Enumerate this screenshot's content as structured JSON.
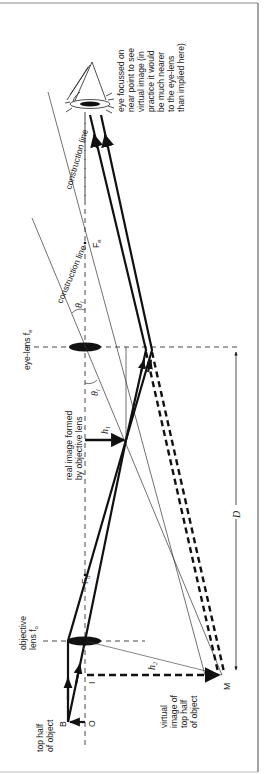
{
  "diagram": {
    "labels": {
      "eye_note": [
        "eye focussed on",
        "near point to see",
        "virtual image (in",
        "practice it would",
        "be much nearer",
        "to the eye-lens",
        "than implied here)"
      ],
      "construction_line_upper": "construction line",
      "construction_line_lower": "construction line",
      "focal_eye": "F",
      "focal_eye_sub": "e",
      "focal_obj": "F",
      "focal_obj_sub": "o",
      "theta_upper": "θ",
      "theta_upper_sub": "l",
      "theta_lower": "θ",
      "theta_lower_sub": "l",
      "eye_lens": "eye-lens f",
      "eye_lens_sub": "e",
      "real_image": [
        "real image formed",
        "by objective lens"
      ],
      "h1": "h",
      "h1_sub": "1",
      "h2": "h",
      "h2_sub": "2",
      "distance_D": "D",
      "objective_lens": [
        "objective",
        "lens f"
      ],
      "objective_lens_sub": "o",
      "top_half": [
        "top half",
        "of object"
      ],
      "point_B": "B",
      "point_O": "O",
      "point_I": "I",
      "point_M": "M",
      "virtual_image": [
        "virtual",
        "image of",
        "top half",
        "of object"
      ]
    },
    "colors": {
      "ink": "#111111",
      "thin": "#333333",
      "border": "#777777"
    }
  }
}
